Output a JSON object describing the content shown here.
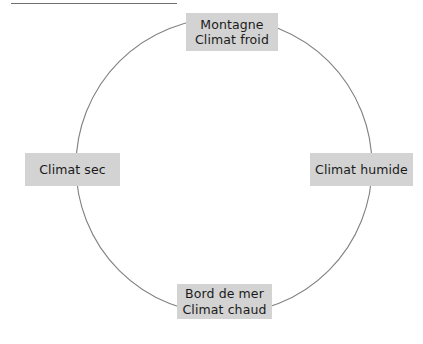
{
  "diagram": {
    "type": "cycle",
    "shape": "circle",
    "circle": {
      "center_x": 224,
      "center_y": 166,
      "radius": 148,
      "stroke_color": "#808080"
    },
    "box_color": "#d3d3d3",
    "text_color": "#1a1a1a",
    "nodes": [
      {
        "position": "top",
        "lines": [
          "Montagne",
          "Climat froid"
        ]
      },
      {
        "position": "right",
        "lines": [
          "Climat humide"
        ]
      },
      {
        "position": "bottom",
        "lines": [
          "Bord de mer",
          "Climat chaud"
        ]
      },
      {
        "position": "left",
        "lines": [
          "Climat sec"
        ]
      }
    ]
  },
  "top_rule": {
    "color": "#6e6e6e"
  }
}
